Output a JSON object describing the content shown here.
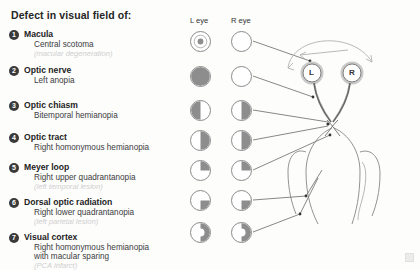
{
  "title": "Defect in visual field of:",
  "columns": {
    "left_label": "L eye",
    "right_label": "R eye"
  },
  "colors": {
    "fill": "#8d8d8d",
    "outline": "#8a8a8a",
    "badge": "#3a3a3a",
    "lesion_text": "#cfcfcf",
    "background": "#fdfdfc",
    "line": "#555555"
  },
  "brain": {
    "left_eye_label": "L",
    "right_eye_label": "R"
  },
  "items": [
    {
      "number": "1",
      "structure": "Macula",
      "defect": "Central scotoma",
      "lesion": "(macular degeneration)",
      "left_field": "central-scotoma",
      "right_field": "normal"
    },
    {
      "number": "2",
      "structure": "Optic nerve",
      "defect": "Left anopia",
      "lesion": "",
      "left_field": "full",
      "right_field": "normal"
    },
    {
      "number": "3",
      "structure": "Optic chiasm",
      "defect": "Bitemporal hemianopia",
      "lesion": "",
      "left_field": "left-half",
      "right_field": "right-half"
    },
    {
      "number": "4",
      "structure": "Optic tract",
      "defect": "Right homonymous hemianopia",
      "lesion": "",
      "left_field": "right-half",
      "right_field": "right-half"
    },
    {
      "number": "5",
      "structure": "Meyer loop",
      "defect": "Right upper quadrantanopia",
      "lesion": "(left temporal lesion)",
      "left_field": "upper-right-quadrant",
      "right_field": "upper-right-quadrant"
    },
    {
      "number": "6",
      "structure": "Dorsal optic radiation",
      "defect": "Right lower quadrantanopia",
      "lesion": "(left parietal lesion)",
      "left_field": "lower-right-quadrant",
      "right_field": "lower-right-quadrant"
    },
    {
      "number": "7",
      "structure": "Visual cortex",
      "defect": "Right homonymous hemianopia",
      "defect2": "with macular sparing",
      "lesion": "(PCA infarct)",
      "left_field": "right-half-macular-sparing",
      "right_field": "right-half-macular-sparing"
    }
  ]
}
